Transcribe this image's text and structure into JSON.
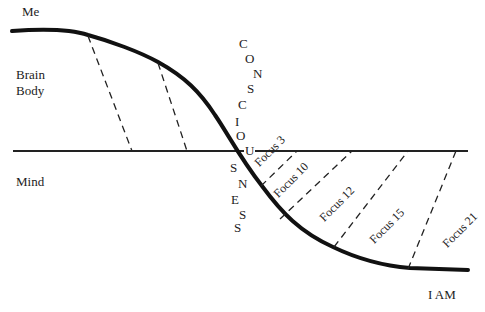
{
  "labels": {
    "top_left": "Me",
    "upper_region": [
      "Brain",
      "Body"
    ],
    "lower_region": "Mind",
    "bottom_right": "I AM"
  },
  "vertical_word": {
    "text": "CONSCIOUSNESS",
    "letters": [
      "C",
      "O",
      "N",
      "S",
      "C",
      "I",
      "O",
      "U",
      "S",
      "N",
      "E",
      "S",
      "S"
    ]
  },
  "focus_levels": [
    {
      "label": "Focus 3"
    },
    {
      "label": "Focus 10"
    },
    {
      "label": "Focus 12"
    },
    {
      "label": "Focus 15"
    },
    {
      "label": "Focus 21"
    }
  ],
  "colors": {
    "line": "#111111",
    "text": "#222222",
    "background": "#ffffff"
  }
}
